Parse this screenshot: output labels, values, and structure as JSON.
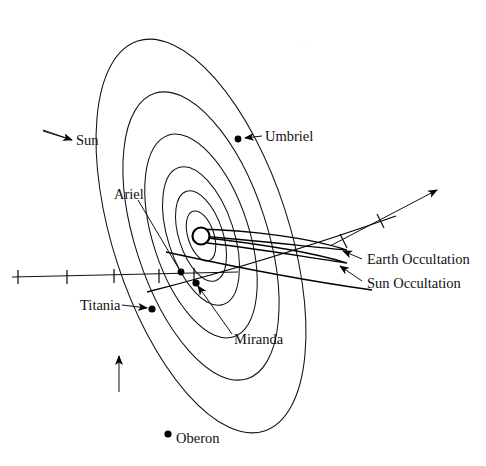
{
  "figure": {
    "name": "uranian-satellite-system-occultation-diagram",
    "background_color": "#ffffff",
    "stroke_color": "#111111",
    "width": 486,
    "height": 466
  },
  "labels": {
    "sun": "Sun",
    "ariel": "Ariel",
    "umbriel": "Umbriel",
    "titania": "Titania",
    "miranda": "Miranda",
    "oberon": "Oberon",
    "earth_occultation": "Earth Occultation",
    "sun_occultation": "Sun Occultation"
  },
  "satellites": [
    {
      "name": "Miranda",
      "label": "Miranda",
      "orbit_index": 1,
      "dot_x": 196,
      "dot_y": 283
    },
    {
      "name": "Ariel",
      "label": "Ariel",
      "orbit_index": 2,
      "dot_x": 181,
      "dot_y": 272
    },
    {
      "name": "Umbriel",
      "label": "Umbriel",
      "orbit_index": 3,
      "dot_x": 238,
      "dot_y": 139
    },
    {
      "name": "Titania",
      "label": "Titania",
      "orbit_index": 4,
      "dot_x": 152,
      "dot_y": 309
    },
    {
      "name": "Oberon",
      "label": "Oberon",
      "orbit_index": 5,
      "dot_x": 168,
      "dot_y": 434
    }
  ],
  "central_body": {
    "name": "Uranus",
    "cx": 201,
    "cy": 236,
    "r": 8.5
  },
  "orbits": [
    {
      "index": 0,
      "rx": 13,
      "ry": 26,
      "rotation": -18
    },
    {
      "index": 1,
      "rx": 22,
      "ry": 47,
      "rotation": -18
    },
    {
      "index": 2,
      "rx": 33,
      "ry": 72,
      "rotation": -18
    },
    {
      "index": 3,
      "rx": 48,
      "ry": 106,
      "rotation": -18
    },
    {
      "index": 4,
      "rx": 66,
      "ry": 150,
      "rotation": -18
    },
    {
      "index": 5,
      "rx": 88,
      "ry": 205,
      "rotation": -18
    }
  ],
  "axis": {
    "name": "reference-axis",
    "tick_count": 5,
    "x_start": 12,
    "x_end": 235,
    "y": 277
  },
  "direction_arrow": {
    "name": "orbital-motion-arrow",
    "description": "upward arrow indicating direction of orbital motion"
  },
  "sun_arrow": {
    "name": "sun-direction-arrow",
    "description": "arrow pointing toward the Sun"
  },
  "earth_arrow": {
    "name": "earth-direction-arrow",
    "description": "arrow with tick marks pointing toward Earth",
    "tick_count": 2
  },
  "occultation_tracks": [
    {
      "name": "Earth Occultation",
      "label": "Earth Occultation"
    },
    {
      "name": "Sun Occultation",
      "label": "Sun Occultation"
    }
  ]
}
